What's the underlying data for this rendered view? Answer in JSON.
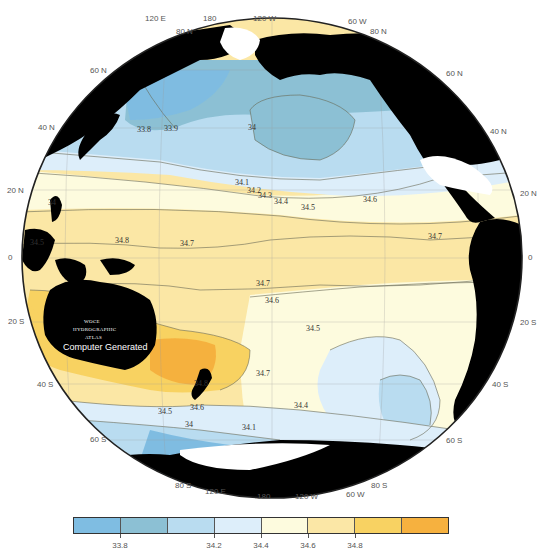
{
  "figure": {
    "projection": "orthographic Pacific-centered",
    "variable": "salinity"
  },
  "top_longitude_labels": [
    "120 E",
    "180",
    "120 W",
    "60 W"
  ],
  "bottom_longitude_labels": [
    "120 E",
    "180",
    "120 W",
    "60 W"
  ],
  "left_latitude_labels": [
    "80 N",
    "60 N",
    "40 N",
    "20 N",
    "0",
    "20 S",
    "40 S",
    "60 S",
    "80 S"
  ],
  "right_latitude_labels": [
    "80 N",
    "60 N",
    "40 N",
    "20 N",
    "0",
    "20 S",
    "40 S",
    "60 S",
    "80 S"
  ],
  "atlas_mark": {
    "line1": "WOCE",
    "line2": "HYDROGRAPHIC",
    "line3": "ATLAS",
    "line4": "Computer Generated"
  },
  "contour_labels": [
    {
      "text": "33.8",
      "x": 137,
      "y": 132
    },
    {
      "text": "33.9",
      "x": 164,
      "y": 131
    },
    {
      "text": "34",
      "x": 248,
      "y": 130
    },
    {
      "text": "34.1",
      "x": 235,
      "y": 185
    },
    {
      "text": "34.2",
      "x": 247,
      "y": 193
    },
    {
      "text": "34.3",
      "x": 258,
      "y": 198
    },
    {
      "text": "34.4",
      "x": 274,
      "y": 204
    },
    {
      "text": "34.5",
      "x": 301,
      "y": 210
    },
    {
      "text": "34.6",
      "x": 363,
      "y": 202
    },
    {
      "text": "34.7",
      "x": 428,
      "y": 239
    },
    {
      "text": "34.8",
      "x": 115,
      "y": 243
    },
    {
      "text": "34.7",
      "x": 180,
      "y": 246
    },
    {
      "text": "34.7",
      "x": 256,
      "y": 286
    },
    {
      "text": "34.6",
      "x": 265,
      "y": 303
    },
    {
      "text": "34.5",
      "x": 306,
      "y": 331
    },
    {
      "text": "34.7",
      "x": 256,
      "y": 376
    },
    {
      "text": "34.8",
      "x": 194,
      "y": 386
    },
    {
      "text": "34.6",
      "x": 190,
      "y": 410
    },
    {
      "text": "34.5",
      "x": 158,
      "y": 414
    },
    {
      "text": "34",
      "x": 185,
      "y": 427
    },
    {
      "text": "34.4",
      "x": 294,
      "y": 408
    },
    {
      "text": "34.1",
      "x": 242,
      "y": 430
    },
    {
      "text": "34.5",
      "x": 30,
      "y": 245
    },
    {
      "text": "34",
      "x": 48,
      "y": 205
    }
  ],
  "colorbar": {
    "colors": [
      "#7fbde2",
      "#8cc0d4",
      "#b9dcf0",
      "#ddeefa",
      "#fdfbde",
      "#fbe7a6",
      "#f8d262",
      "#f6b13f"
    ],
    "tick_labels": [
      {
        "text": "33.8",
        "pos": 1
      },
      {
        "text": "34.2",
        "pos": 3
      },
      {
        "text": "34.4",
        "pos": 4
      },
      {
        "text": "34.6",
        "pos": 5
      },
      {
        "text": "34.8",
        "pos": 6
      }
    ]
  },
  "colors": {
    "land": "#000000",
    "ice": "#ffffff",
    "ocean_fresh": "#7fbde2",
    "ocean_mid": "#fdfbde",
    "ocean_salty": "#f6b13f"
  }
}
